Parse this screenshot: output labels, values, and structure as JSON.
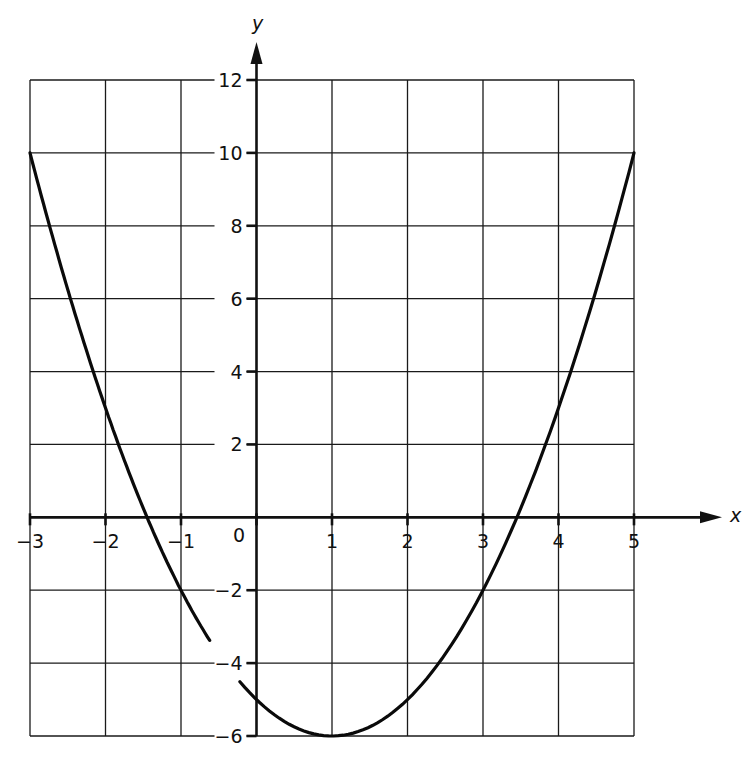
{
  "chart_data": {
    "type": "line",
    "title": "",
    "xlabel": "x",
    "ylabel": "y",
    "xlim": [
      -3,
      5
    ],
    "ylim": [
      -6,
      12
    ],
    "grid": true,
    "legend": null,
    "x_ticks": [
      "-3",
      "-2",
      "-1",
      "0",
      "1",
      "2",
      "3",
      "4",
      "5"
    ],
    "y_ticks": [
      "12",
      "10",
      "8",
      "6",
      "4",
      "2",
      "-2",
      "-4",
      "-6"
    ],
    "series": [
      {
        "name": "y = x^2 - 2x - 5",
        "x": [
          -3,
          -2,
          -1,
          0,
          1,
          2,
          3,
          4,
          5
        ],
        "y": [
          10,
          3,
          -2,
          -5,
          -6,
          -5,
          -2,
          3,
          10
        ]
      }
    ],
    "annotations": [
      "Curve drawn with a small gap between x ≈ -0.7 and x ≈ -0.2"
    ]
  },
  "labels": {
    "x_axis": "x",
    "y_axis": "y",
    "origin": "0",
    "x_tick_labels": [
      {
        "text": "−3",
        "v": -3
      },
      {
        "text": "−2",
        "v": -2
      },
      {
        "text": "−1",
        "v": -1
      },
      {
        "text": "1",
        "v": 1
      },
      {
        "text": "2",
        "v": 2
      },
      {
        "text": "3",
        "v": 3
      },
      {
        "text": "4",
        "v": 4
      },
      {
        "text": "5",
        "v": 5
      }
    ],
    "y_tick_labels": [
      {
        "text": "12",
        "v": 12
      },
      {
        "text": "10",
        "v": 10
      },
      {
        "text": "8",
        "v": 8
      },
      {
        "text": "6",
        "v": 6
      },
      {
        "text": "4",
        "v": 4
      },
      {
        "text": "2",
        "v": 2
      },
      {
        "text": "−2",
        "v": -2
      },
      {
        "text": "−4",
        "v": -4
      },
      {
        "text": "−6",
        "v": -6
      }
    ]
  }
}
